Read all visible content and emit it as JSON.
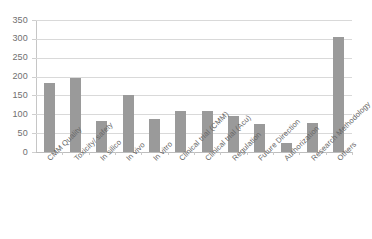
{
  "chart_data": {
    "type": "bar",
    "title": "",
    "subtitle": "",
    "xlabel": "",
    "ylabel": "",
    "ylim": [
      0,
      350
    ],
    "ytick_step": 50,
    "yticks": [
      350,
      300,
      250,
      200,
      150,
      100,
      50,
      0
    ],
    "grid": true,
    "legend": "none",
    "bar_color": "#9a9a9a",
    "gridline_color": "#d9d9d9",
    "categories": [
      "CMM Quality",
      "Toxicity/ safety",
      "In silico",
      "In vivo",
      "In vitro",
      "Clinical trial (CMM)",
      "Clinical trial (Acu)",
      "Regulation",
      "Future Direction",
      "Authorization",
      "Research Methodology",
      "Others"
    ],
    "values": [
      183,
      196,
      82,
      150,
      88,
      110,
      108,
      95,
      74,
      24,
      77,
      305
    ]
  }
}
